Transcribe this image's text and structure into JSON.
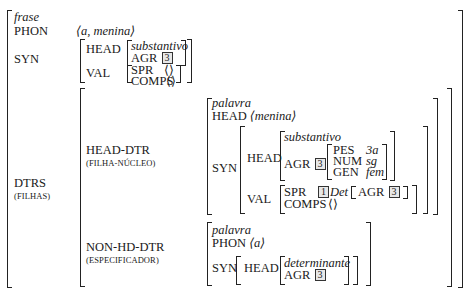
{
  "avm": {
    "type": "frase",
    "phon_label": "PHON",
    "phon_value": "⟨a, menina⟩",
    "syn_label": "SYN",
    "syn": {
      "head_label": "HEAD",
      "head_type": "substantivo",
      "agr_label": "AGR",
      "agr_tag": "3",
      "val_label": "VAL",
      "spr_label": "SPR",
      "spr_value": "⟨⟩",
      "comps_label": "COMPS",
      "comps_value": "⟨⟩"
    },
    "dtrs_label": "DTRS",
    "dtrs_gloss": "(FILHAS)",
    "head_dtr": {
      "label": "HEAD-DTR",
      "gloss": "(FILHA-NÚCLEO)",
      "type": "palavra",
      "head_label": "HEAD",
      "phon_value": "⟨menina⟩",
      "syn_label": "SYN",
      "syn": {
        "head_label": "HEAD",
        "head_type": "substantivo",
        "agr_label": "AGR",
        "agr_tag": "3",
        "pes_label": "PES",
        "pes_value": "3a",
        "num_label": "NUM",
        "num_value": "sg",
        "gen_label": "GEN",
        "gen_value": "fem",
        "val_label": "VAL",
        "spr_label": "SPR",
        "spr_tag": "1",
        "spr_cat": "Det",
        "spr_agr_label": "AGR",
        "spr_agr_tag": "3",
        "comps_label": "COMPS",
        "comps_value": "⟨⟩"
      }
    },
    "non_hd_dtr": {
      "label": "NON-HD-DTR",
      "gloss": "(ESPECIFICADOR)",
      "type": "palavra",
      "phon_label": "PHON",
      "phon_value": "⟨a⟩",
      "syn_label": "SYN",
      "head_label": "HEAD",
      "head_type": "determinante",
      "agr_label": "AGR",
      "agr_tag": "3"
    }
  }
}
